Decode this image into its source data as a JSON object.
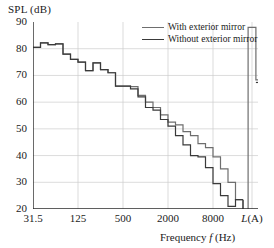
{
  "chart_data": {
    "type": "line",
    "title": "",
    "ylabel": "SPL (dB)",
    "xlabel": "Frequency f (Hz)",
    "ylim": [
      20,
      90
    ],
    "yticks": [
      20,
      30,
      40,
      50,
      60,
      70,
      80,
      90
    ],
    "xticks": [
      "31.5",
      "125",
      "500",
      "2000",
      "8000",
      "L(A)"
    ],
    "xtick_positions": [
      0,
      6,
      12,
      18,
      24,
      29.2
    ],
    "grid": true,
    "legend_position": "top-right",
    "x_categories": [
      31.5,
      40,
      50,
      63,
      80,
      100,
      125,
      160,
      200,
      250,
      315,
      400,
      500,
      630,
      800,
      1000,
      1250,
      1600,
      2000,
      2500,
      3150,
      4000,
      5000,
      6300,
      8000,
      10000,
      12500,
      16000
    ],
    "series": [
      {
        "name": "With exterior mirror",
        "color": "#6e6e6e",
        "values": [
          80.5,
          82.2,
          81.5,
          81.8,
          78.0,
          76.0,
          75.0,
          71.8,
          74.7,
          72.2,
          71.0,
          66.0,
          66.0,
          65.8,
          62.5,
          60.0,
          58.0,
          55.2,
          52.5,
          51.5,
          49.0,
          47.5,
          44.5,
          43.0,
          39.5,
          35.0,
          30.0,
          23.5
        ]
      },
      {
        "name": "Without exterior mirror",
        "color": "#3a3a3a",
        "values": [
          80.5,
          82.2,
          81.5,
          81.8,
          78.0,
          76.0,
          75.0,
          71.8,
          74.7,
          72.2,
          71.0,
          66.0,
          66.0,
          65.0,
          62.0,
          58.0,
          57.0,
          53.5,
          51.0,
          47.5,
          44.0,
          40.0,
          39.5,
          35.5,
          29.5,
          25.0,
          21.0,
          23.5
        ]
      }
    ],
    "overall_levels": {
      "label": "L(A)",
      "with_exterior_mirror": 88.0,
      "without_exterior_mirror": 68.3
    },
    "annotations": []
  },
  "legend": {
    "items": [
      {
        "label": "With exterior mirror"
      },
      {
        "label": "Without exterior mirror"
      }
    ]
  },
  "axes": {
    "y_title": "SPL (dB)",
    "x_title_prefix": "Frequency ",
    "x_title_italic": "f",
    "x_title_suffix": " (Hz)",
    "x_last_tick_italic": "L",
    "x_last_tick_rest": "(A)"
  },
  "colors": {
    "series_light": "#6e6e6e",
    "series_dark": "#3a3a3a",
    "axis": "#2a2a2a",
    "grid": "#cccccc",
    "background": "#ffffff"
  }
}
